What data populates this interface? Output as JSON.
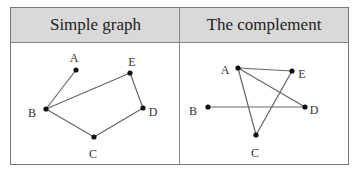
{
  "table": {
    "columns": [
      {
        "header": "Simple graph"
      },
      {
        "header": "The complement"
      }
    ]
  },
  "graphs": {
    "simple": {
      "vertices": [
        {
          "label": "A",
          "x": 76,
          "y": 70,
          "lx": 74,
          "ly": 62
        },
        {
          "label": "E",
          "x": 130,
          "y": 73,
          "lx": 132,
          "ly": 66
        },
        {
          "label": "B",
          "x": 46,
          "y": 109,
          "lx": 32,
          "ly": 117
        },
        {
          "label": "D",
          "x": 143,
          "y": 108,
          "lx": 153,
          "ly": 116
        },
        {
          "label": "C",
          "x": 94,
          "y": 137,
          "lx": 93,
          "ly": 158
        }
      ],
      "edges": [
        [
          "A",
          "B"
        ],
        [
          "B",
          "E"
        ],
        [
          "E",
          "D"
        ],
        [
          "D",
          "C"
        ],
        [
          "C",
          "B"
        ]
      ]
    },
    "complement": {
      "vertices": [
        {
          "label": "A",
          "x": 238,
          "y": 68,
          "lx": 225,
          "ly": 74
        },
        {
          "label": "E",
          "x": 292,
          "y": 71,
          "lx": 302,
          "ly": 78
        },
        {
          "label": "B",
          "x": 208,
          "y": 107,
          "lx": 193,
          "ly": 115
        },
        {
          "label": "D",
          "x": 305,
          "y": 107,
          "lx": 314,
          "ly": 114
        },
        {
          "label": "C",
          "x": 256,
          "y": 135,
          "lx": 255,
          "ly": 157
        }
      ],
      "edges": [
        [
          "A",
          "E"
        ],
        [
          "A",
          "D"
        ],
        [
          "A",
          "C"
        ],
        [
          "C",
          "E"
        ],
        [
          "B",
          "D"
        ]
      ]
    }
  }
}
